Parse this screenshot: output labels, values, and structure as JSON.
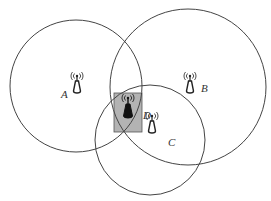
{
  "diagram": {
    "title": "",
    "colors": {
      "background": "#ffffff",
      "circle_stroke": "#444444",
      "overlap_box_fill": "#b3b3b3",
      "overlap_box_stroke": "#555555",
      "tower_outline": "#222222",
      "tower_dark_fill": "#111111"
    },
    "coverage_circles": [
      {
        "id": "A",
        "cx": 76,
        "cy": 86,
        "r": 66
      },
      {
        "id": "B",
        "cx": 188,
        "cy": 87,
        "r": 78
      },
      {
        "id": "C",
        "cx": 150,
        "cy": 140,
        "r": 55
      }
    ],
    "overlap_region": {
      "id": "D",
      "x": 114,
      "y": 93,
      "width": 28,
      "height": 39
    },
    "nodes": [
      {
        "id": "A",
        "label": "A",
        "icon": "antenna-tower-icon",
        "style": "outline",
        "x": 77,
        "y": 80,
        "label_x": 62,
        "label_y": 98
      },
      {
        "id": "B",
        "label": "B",
        "icon": "antenna-tower-icon",
        "style": "outline",
        "x": 190,
        "y": 82,
        "label_x": 202,
        "label_y": 91
      },
      {
        "id": "C",
        "label": "C",
        "icon": "antenna-tower-icon",
        "style": "outline",
        "x": 152,
        "y": 122,
        "label_x": 169,
        "label_y": 145
      },
      {
        "id": "D",
        "label": "D",
        "icon": "antenna-tower-icon",
        "style": "filled",
        "x": 128,
        "y": 106,
        "label_x": 144,
        "label_y": 118
      }
    ]
  }
}
